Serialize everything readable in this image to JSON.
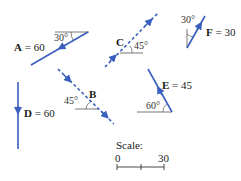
{
  "colors": {
    "vector": "#3a5fbf",
    "reference_line": "#555555",
    "text": "#1a1a1a",
    "background": "#ffffff"
  },
  "vectors": {
    "A": {
      "letter": "A",
      "eq": " = 60",
      "magnitude": 60,
      "angle": "30°",
      "angle_ref": "horizontal",
      "style": "solid",
      "direction": "down-left"
    },
    "B": {
      "letter": "B",
      "magnitude": null,
      "angle": "45°",
      "angle_ref": "horizontal",
      "style": "dashed",
      "direction": "down-right"
    },
    "C": {
      "letter": "C",
      "magnitude": null,
      "angle": "45°",
      "angle_ref": "horizontal",
      "style": "dashed",
      "direction": "up-right"
    },
    "D": {
      "letter": "D",
      "eq": " = 60",
      "magnitude": 60,
      "angle": null,
      "style": "solid",
      "direction": "down"
    },
    "E": {
      "letter": "E",
      "eq": " = 45",
      "magnitude": 45,
      "angle": "60°",
      "angle_ref": "horizontal",
      "style": "solid",
      "direction": "up-left"
    },
    "F": {
      "letter": "F",
      "eq": " = 30",
      "magnitude": 30,
      "angle": "30°",
      "angle_ref": "vertical",
      "style": "solid",
      "direction": "up-right"
    }
  },
  "scale": {
    "title": "Scale:",
    "start": "0",
    "end": "30"
  }
}
